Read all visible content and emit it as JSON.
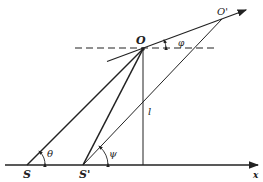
{
  "diagram": {
    "type": "geometry",
    "points": {
      "S": {
        "label": "S",
        "x": 27,
        "y": 165
      },
      "S_prime": {
        "label": "S'",
        "x": 83,
        "y": 165
      },
      "O": {
        "label": "O",
        "x": 143,
        "y": 49
      },
      "O_prime": {
        "label": "O'",
        "x": 222,
        "y": 19
      }
    },
    "labels": {
      "S": "S",
      "S_prime": "S'",
      "O": "O",
      "O_prime": "O'",
      "x_axis": "x",
      "length": "l",
      "theta": "θ",
      "psi": "ψ",
      "phi": "φ"
    },
    "colors": {
      "ink": "#222222",
      "background": "#ffffff"
    }
  }
}
